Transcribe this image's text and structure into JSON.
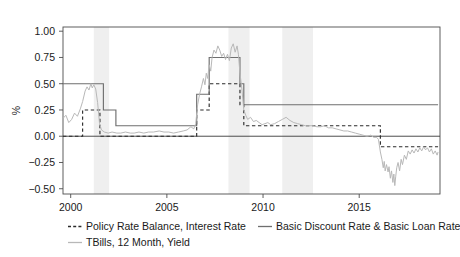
{
  "chart_data": {
    "type": "line",
    "title": "",
    "xlabel": "",
    "ylabel": "%",
    "xlim": [
      1999.6,
      2019.2
    ],
    "ylim": [
      -0.55,
      1.04
    ],
    "grid": false,
    "legend_position": "bottom-left",
    "yticks": [
      "1.00",
      "0.75",
      "0.50",
      "0.25",
      "0.00",
      "-0.25",
      "-0.50"
    ],
    "ytick_values": [
      1.0,
      0.75,
      0.5,
      0.25,
      0.0,
      -0.25,
      -0.5
    ],
    "xticks": [
      "2000",
      "2005",
      "2010",
      "2015"
    ],
    "xtick_values": [
      2000,
      2005,
      2010,
      2015
    ],
    "zero_line": 0.0,
    "shaded_bands": [
      {
        "start": 2001.2,
        "end": 2002.0
      },
      {
        "start": 2008.2,
        "end": 2009.3
      },
      {
        "start": 2011.0,
        "end": 2012.6
      }
    ],
    "series": [
      {
        "name": "Policy Rate Balance, Interest Rate",
        "style": "dashed",
        "color": "#2b2b2b",
        "step": true,
        "points": [
          [
            1999.6,
            0.0
          ],
          [
            2000.6,
            0.0
          ],
          [
            2000.62,
            0.25
          ],
          [
            2001.5,
            0.25
          ],
          [
            2001.52,
            0.0
          ],
          [
            2006.5,
            0.0
          ],
          [
            2006.55,
            0.25
          ],
          [
            2007.15,
            0.25
          ],
          [
            2007.2,
            0.5
          ],
          [
            2008.75,
            0.5
          ],
          [
            2008.8,
            0.3
          ],
          [
            2008.95,
            0.3
          ],
          [
            2009.0,
            0.1
          ],
          [
            2016.05,
            0.1
          ],
          [
            2016.1,
            -0.1
          ],
          [
            2019.1,
            -0.1
          ]
        ]
      },
      {
        "name": "Basic Discount Rate & Basic Loan Rate",
        "style": "solid",
        "color": "#6f6f6f",
        "step": true,
        "points": [
          [
            1999.6,
            0.5
          ],
          [
            2001.65,
            0.5
          ],
          [
            2001.7,
            0.25
          ],
          [
            2002.3,
            0.25
          ],
          [
            2002.35,
            0.1
          ],
          [
            2006.5,
            0.1
          ],
          [
            2006.55,
            0.4
          ],
          [
            2007.15,
            0.4
          ],
          [
            2007.2,
            0.75
          ],
          [
            2008.75,
            0.75
          ],
          [
            2008.8,
            0.5
          ],
          [
            2008.95,
            0.5
          ],
          [
            2009.0,
            0.3
          ],
          [
            2019.1,
            0.3
          ]
        ]
      },
      {
        "name": "TBills, 12 Month, Yield",
        "style": "solid-light",
        "color": "#b8b8b8",
        "step": false,
        "points": [
          [
            1999.6,
            0.17
          ],
          [
            1999.75,
            0.2
          ],
          [
            1999.9,
            0.13
          ],
          [
            2000.05,
            0.16
          ],
          [
            2000.2,
            0.22
          ],
          [
            2000.35,
            0.19
          ],
          [
            2000.5,
            0.26
          ],
          [
            2000.62,
            0.33
          ],
          [
            2000.75,
            0.43
          ],
          [
            2000.85,
            0.47
          ],
          [
            2000.95,
            0.44
          ],
          [
            2001.05,
            0.5
          ],
          [
            2001.12,
            0.46
          ],
          [
            2001.2,
            0.49
          ],
          [
            2001.3,
            0.45
          ],
          [
            2001.4,
            0.32
          ],
          [
            2001.5,
            0.12
          ],
          [
            2001.6,
            0.06
          ],
          [
            2001.75,
            0.04
          ],
          [
            2001.95,
            0.03
          ],
          [
            2002.15,
            0.04
          ],
          [
            2002.4,
            0.03
          ],
          [
            2002.6,
            0.03
          ],
          [
            2002.85,
            0.04
          ],
          [
            2003.1,
            0.03
          ],
          [
            2003.3,
            0.03
          ],
          [
            2003.55,
            0.04
          ],
          [
            2003.8,
            0.03
          ],
          [
            2004.05,
            0.04
          ],
          [
            2004.3,
            0.04
          ],
          [
            2004.6,
            0.05
          ],
          [
            2004.85,
            0.04
          ],
          [
            2005.1,
            0.04
          ],
          [
            2005.35,
            0.03
          ],
          [
            2005.6,
            0.04
          ],
          [
            2005.85,
            0.05
          ],
          [
            2006.05,
            0.06
          ],
          [
            2006.25,
            0.09
          ],
          [
            2006.4,
            0.07
          ],
          [
            2006.5,
            0.12
          ],
          [
            2006.6,
            0.3
          ],
          [
            2006.7,
            0.4
          ],
          [
            2006.8,
            0.47
          ],
          [
            2006.9,
            0.55
          ],
          [
            2006.98,
            0.49
          ],
          [
            2007.05,
            0.6
          ],
          [
            2007.12,
            0.55
          ],
          [
            2007.2,
            0.68
          ],
          [
            2007.28,
            0.62
          ],
          [
            2007.35,
            0.75
          ],
          [
            2007.45,
            0.82
          ],
          [
            2007.55,
            0.79
          ],
          [
            2007.65,
            0.86
          ],
          [
            2007.75,
            0.82
          ],
          [
            2007.85,
            0.76
          ],
          [
            2007.95,
            0.79
          ],
          [
            2008.05,
            0.73
          ],
          [
            2008.15,
            0.78
          ],
          [
            2008.25,
            0.72
          ],
          [
            2008.35,
            0.84
          ],
          [
            2008.45,
            0.88
          ],
          [
            2008.55,
            0.8
          ],
          [
            2008.65,
            0.86
          ],
          [
            2008.72,
            0.78
          ],
          [
            2008.8,
            0.6
          ],
          [
            2008.9,
            0.45
          ],
          [
            2009.0,
            0.25
          ],
          [
            2009.1,
            0.2
          ],
          [
            2009.2,
            0.16
          ],
          [
            2009.35,
            0.18
          ],
          [
            2009.5,
            0.14
          ],
          [
            2009.65,
            0.15
          ],
          [
            2009.8,
            0.13
          ],
          [
            2009.95,
            0.11
          ],
          [
            2010.1,
            0.12
          ],
          [
            2010.25,
            0.13
          ],
          [
            2010.4,
            0.11
          ],
          [
            2010.6,
            0.12
          ],
          [
            2010.8,
            0.14
          ],
          [
            2011.0,
            0.16
          ],
          [
            2011.2,
            0.18
          ],
          [
            2011.4,
            0.15
          ],
          [
            2011.6,
            0.13
          ],
          [
            2011.8,
            0.12
          ],
          [
            2012.0,
            0.11
          ],
          [
            2012.2,
            0.1
          ],
          [
            2012.4,
            0.1
          ],
          [
            2012.6,
            0.1
          ],
          [
            2012.8,
            0.09
          ],
          [
            2013.0,
            0.09
          ],
          [
            2013.2,
            0.1
          ],
          [
            2013.4,
            0.08
          ],
          [
            2013.6,
            0.08
          ],
          [
            2013.8,
            0.07
          ],
          [
            2014.0,
            0.06
          ],
          [
            2014.2,
            0.05
          ],
          [
            2014.4,
            0.05
          ],
          [
            2014.6,
            0.04
          ],
          [
            2014.8,
            0.03
          ],
          [
            2015.0,
            0.02
          ],
          [
            2015.2,
            0.01
          ],
          [
            2015.4,
            0.0
          ],
          [
            2015.6,
            0.01
          ],
          [
            2015.75,
            -0.01
          ],
          [
            2015.9,
            -0.01
          ],
          [
            2016.0,
            -0.03
          ],
          [
            2016.1,
            -0.15
          ],
          [
            2016.18,
            -0.22
          ],
          [
            2016.25,
            -0.3
          ],
          [
            2016.3,
            -0.24
          ],
          [
            2016.35,
            -0.33
          ],
          [
            2016.42,
            -0.27
          ],
          [
            2016.5,
            -0.34
          ],
          [
            2016.55,
            -0.29
          ],
          [
            2016.62,
            -0.4
          ],
          [
            2016.68,
            -0.33
          ],
          [
            2016.75,
            -0.44
          ],
          [
            2016.8,
            -0.36
          ],
          [
            2016.85,
            -0.47
          ],
          [
            2016.9,
            -0.38
          ],
          [
            2016.95,
            -0.3
          ],
          [
            2017.02,
            -0.25
          ],
          [
            2017.1,
            -0.33
          ],
          [
            2017.18,
            -0.22
          ],
          [
            2017.25,
            -0.27
          ],
          [
            2017.35,
            -0.18
          ],
          [
            2017.45,
            -0.22
          ],
          [
            2017.55,
            -0.14
          ],
          [
            2017.65,
            -0.17
          ],
          [
            2017.75,
            -0.13
          ],
          [
            2017.85,
            -0.16
          ],
          [
            2017.95,
            -0.12
          ],
          [
            2018.05,
            -0.15
          ],
          [
            2018.15,
            -0.11
          ],
          [
            2018.25,
            -0.14
          ],
          [
            2018.35,
            -0.1
          ],
          [
            2018.45,
            -0.13
          ],
          [
            2018.55,
            -0.11
          ],
          [
            2018.65,
            -0.15
          ],
          [
            2018.75,
            -0.12
          ],
          [
            2018.85,
            -0.17
          ],
          [
            2018.95,
            -0.14
          ],
          [
            2019.05,
            -0.18
          ],
          [
            2019.1,
            -0.15
          ]
        ]
      }
    ]
  },
  "axis": {
    "ylabel": "%",
    "yticks": [
      "1.00",
      "0.75",
      "0.50",
      "0.25",
      "0.00",
      "-0.25",
      "-0.50"
    ],
    "xticks": [
      "2000",
      "2005",
      "2010",
      "2015"
    ]
  },
  "legend": {
    "items": [
      {
        "label": "Policy Rate Balance, Interest Rate",
        "marker": "dashed-line-marker",
        "color": "#2b2b2b"
      },
      {
        "label": "Basic Discount Rate & Basic Loan Rate",
        "marker": "solid-line-marker",
        "color": "#6f6f6f"
      },
      {
        "label": "TBills, 12 Month, Yield",
        "marker": "solid-line-marker",
        "color": "#b8b8b8"
      }
    ]
  },
  "colors": {
    "policy_rate": "#2b2b2b",
    "discount_rate": "#6f6f6f",
    "tbills": "#b8b8b8",
    "band": "#efefef",
    "axis": "#4d4d4d",
    "background": "#ffffff"
  }
}
